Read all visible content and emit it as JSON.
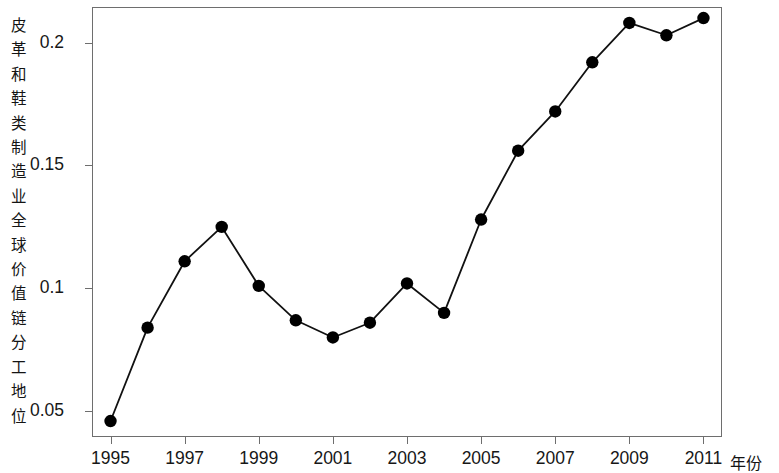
{
  "chart_data": {
    "type": "line",
    "title": "",
    "subtitle": "",
    "xlabel": "年份",
    "ylabel": "皮革和鞋类制造业全球价值链分工地位",
    "x": [
      1995,
      1996,
      1997,
      1998,
      1999,
      2000,
      2001,
      2002,
      2003,
      2004,
      2005,
      2006,
      2007,
      2008,
      2009,
      2010,
      2011
    ],
    "values": [
      0.046,
      0.084,
      0.111,
      0.125,
      0.101,
      0.087,
      0.08,
      0.086,
      0.102,
      0.09,
      0.128,
      0.156,
      0.172,
      0.192,
      0.208,
      0.203,
      0.21
    ],
    "series": [
      {
        "name": "皮革和鞋类制造业全球价值链分工地位",
        "values": [
          0.046,
          0.084,
          0.111,
          0.125,
          0.101,
          0.087,
          0.08,
          0.086,
          0.102,
          0.09,
          0.128,
          0.156,
          0.172,
          0.192,
          0.208,
          0.203,
          0.21
        ]
      }
    ],
    "xlim": [
      1994.5,
      2011.5
    ],
    "ylim": [
      0.0395,
      0.2145
    ],
    "xticks": [
      1995,
      1997,
      1999,
      2001,
      2003,
      2005,
      2007,
      2009,
      2011
    ],
    "xtick_labels": [
      "1995",
      "1997",
      "1999",
      "2001",
      "2003",
      "2005",
      "2007",
      "2009",
      "2011"
    ],
    "yticks": [
      0.05,
      0.1,
      0.15,
      0.2
    ],
    "ytick_labels": [
      "0.05",
      "0.1",
      "0.15",
      "0.2"
    ],
    "grid": false,
    "legend": false,
    "legend_position": "none",
    "marker": "filled-circle",
    "line_color": "#111111",
    "marker_color": "#000000",
    "axis_color": "#6e6e6e",
    "background_color": "#ffffff"
  }
}
